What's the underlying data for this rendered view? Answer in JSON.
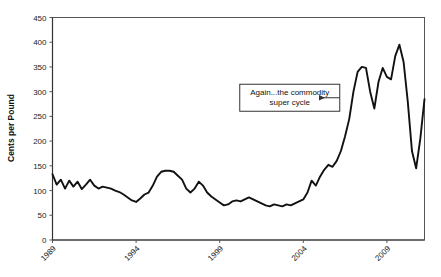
{
  "chart_data": {
    "type": "line",
    "title": "",
    "subtitle": "",
    "xlabel": "",
    "ylabel": "Cents per Pound",
    "ylim": [
      0,
      450
    ],
    "xlim": [
      1989,
      2011.25
    ],
    "grid": false,
    "legend": null,
    "y_ticks": [
      0,
      50,
      100,
      150,
      200,
      250,
      300,
      350,
      400,
      450
    ],
    "y_tick_labels": [
      "0",
      "50",
      "100",
      "150",
      "200",
      "250",
      "300",
      "350",
      "400",
      "450"
    ],
    "x_ticks": [
      1989,
      1994,
      1999,
      2004,
      2009
    ],
    "x_tick_labels": [
      "1989",
      "1994",
      "1999",
      "2004",
      "2009"
    ],
    "x_tick_rotation_deg": -45,
    "series": [
      {
        "name": "Price",
        "units": "Cents per Pound",
        "x": [
          1989.0,
          1989.25,
          1989.5,
          1989.75,
          1990.0,
          1990.25,
          1990.5,
          1990.75,
          1991.0,
          1991.25,
          1991.5,
          1991.75,
          1992.0,
          1992.25,
          1992.5,
          1992.75,
          1993.0,
          1993.25,
          1993.5,
          1993.75,
          1994.0,
          1994.25,
          1994.5,
          1994.75,
          1995.0,
          1995.25,
          1995.5,
          1995.75,
          1996.0,
          1996.25,
          1996.5,
          1996.75,
          1997.0,
          1997.25,
          1997.5,
          1997.75,
          1998.0,
          1998.25,
          1998.5,
          1998.75,
          1999.0,
          1999.25,
          1999.5,
          1999.75,
          2000.0,
          2000.25,
          2000.5,
          2000.75,
          2001.0,
          2001.25,
          2001.5,
          2001.75,
          2002.0,
          2002.25,
          2002.5,
          2002.75,
          2003.0,
          2003.25,
          2003.5,
          2003.75,
          2004.0,
          2004.25,
          2004.5,
          2004.75,
          2005.0,
          2005.25,
          2005.5,
          2005.75,
          2006.0,
          2006.25,
          2006.5,
          2006.75,
          2007.0,
          2007.25,
          2007.5,
          2007.75,
          2008.0,
          2008.25,
          2008.5,
          2008.75,
          2009.0,
          2009.25,
          2009.5,
          2009.75,
          2010.0,
          2010.25,
          2010.5,
          2010.75,
          2011.0,
          2011.25
        ],
        "values": [
          133,
          112,
          122,
          104,
          120,
          108,
          118,
          103,
          112,
          122,
          110,
          104,
          108,
          106,
          104,
          100,
          97,
          92,
          86,
          80,
          77,
          84,
          92,
          96,
          110,
          128,
          138,
          140,
          140,
          138,
          130,
          122,
          104,
          96,
          104,
          118,
          110,
          96,
          88,
          82,
          76,
          70,
          72,
          78,
          80,
          78,
          82,
          86,
          82,
          78,
          74,
          70,
          68,
          72,
          70,
          68,
          72,
          70,
          74,
          78,
          82,
          96,
          120,
          110,
          128,
          142,
          152,
          148,
          160,
          180,
          210,
          245,
          300,
          340,
          350,
          348,
          300,
          266,
          320,
          348,
          330,
          325,
          372,
          395,
          360,
          280,
          180,
          145,
          205,
          285
        ]
      }
    ],
    "annotations": [
      {
        "text_line_1": "Again...the commodity",
        "text_line_2": "super cycle",
        "box_x_data": 2000.2,
        "box_y_data": 315,
        "arrow_to_x_data": 2005.3,
        "arrow_to_y_data": 258
      }
    ]
  },
  "annotation": {
    "line1": "Again...the commodity",
    "line2": "super cycle"
  },
  "axis": {
    "y_title": "Cents per Pound"
  },
  "colors": {
    "line": "#111111",
    "frame": "#555555",
    "text": "#1a1a1a",
    "background": "#ffffff"
  }
}
